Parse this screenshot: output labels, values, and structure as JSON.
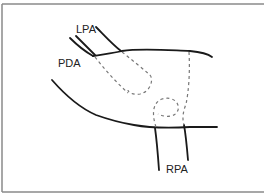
{
  "diagram": {
    "type": "anatomical-line-drawing",
    "labels": {
      "lpa": "LPA",
      "pda": "PDA",
      "rpa": "RPA"
    },
    "colors": {
      "stroke": "#1a1a1a",
      "dashed": "#777777",
      "border": "#8a8a8a",
      "background": "#ffffff"
    }
  }
}
